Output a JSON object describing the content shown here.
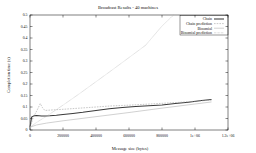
{
  "chart_data": {
    "type": "line",
    "title": "Broadcast Results - 40 machines",
    "xlabel": "Message size (bytes)",
    "ylabel": "Completion time (s)",
    "xlim": [
      0,
      1200000
    ],
    "ylim": [
      0,
      0.5
    ],
    "grid": false,
    "legend_position": "top-right",
    "xticks": [
      0,
      200000,
      400000,
      600000,
      800000,
      1000000,
      1200000
    ],
    "xticklabels": [
      "0",
      "200000",
      "400000",
      "600000",
      "800000",
      "1e+06",
      "1.2e+06"
    ],
    "yticks": [
      0,
      0.05,
      0.1,
      0.15,
      0.2,
      0.25,
      0.3,
      0.35,
      0.4,
      0.45,
      0.5
    ],
    "yticklabels": [
      "0",
      "0.05",
      "0.1",
      "0.15",
      "0.2",
      "0.25",
      "0.3",
      "0.35",
      "0.4",
      "0.45",
      "0.5"
    ],
    "series": [
      {
        "name": "Chain",
        "style": "solid",
        "color": "#3a3a3a",
        "x": [
          0,
          10000,
          25000,
          40000,
          55000,
          70000,
          90000,
          120000,
          160000,
          200000,
          260000,
          320000,
          400000,
          480000,
          560000,
          640000,
          720000,
          800000,
          880000,
          960000,
          1040000,
          1100000
        ],
        "y": [
          0.012,
          0.056,
          0.062,
          0.063,
          0.062,
          0.061,
          0.061,
          0.062,
          0.064,
          0.067,
          0.072,
          0.077,
          0.085,
          0.092,
          0.098,
          0.102,
          0.105,
          0.109,
          0.115,
          0.121,
          0.128,
          0.133
        ]
      },
      {
        "name": "Chain prediction",
        "style": "dashed",
        "color": "#9a9a9a",
        "x": [
          0,
          20000,
          40000,
          55000,
          62000,
          75000,
          90000,
          110000,
          150000,
          200000,
          300000,
          400000,
          500000,
          600000,
          700000,
          800000,
          900000,
          1000000,
          1100000
        ],
        "y": [
          0.012,
          0.055,
          0.082,
          0.104,
          0.115,
          0.098,
          0.085,
          0.086,
          0.088,
          0.09,
          0.095,
          0.1,
          0.105,
          0.108,
          0.112,
          0.116,
          0.12,
          0.125,
          0.13
        ]
      },
      {
        "name": "Binomial",
        "style": "solid-light",
        "color": "#c2c2c2",
        "x": [
          0,
          40000,
          100000,
          200000,
          400000,
          600000,
          800000,
          1000000,
          1100000
        ],
        "y": [
          0.012,
          0.022,
          0.03,
          0.04,
          0.058,
          0.076,
          0.095,
          0.113,
          0.122
        ]
      },
      {
        "name": "Binomial prediction",
        "style": "dotted",
        "color": "#8e8e8e",
        "x": [
          0,
          40000,
          100000,
          200000,
          300000,
          400000,
          500000,
          600000,
          700000,
          800000,
          870000
        ],
        "y": [
          0.012,
          0.033,
          0.06,
          0.108,
          0.158,
          0.21,
          0.262,
          0.315,
          0.368,
          0.452,
          0.5
        ]
      }
    ]
  },
  "legend": {
    "items": [
      {
        "label": "Chain"
      },
      {
        "label": "Chain prediction"
      },
      {
        "label": "Binomial"
      },
      {
        "label": "Binomial prediction"
      }
    ]
  }
}
